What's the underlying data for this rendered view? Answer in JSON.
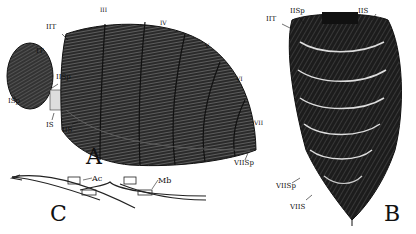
{
  "figure": {
    "panels": [
      {
        "id": "A",
        "label": "A",
        "description": "lateral view of abdomen"
      },
      {
        "id": "B",
        "label": "B",
        "description": "ventral view of abdomen"
      },
      {
        "id": "C",
        "label": "C",
        "description": "section of segments"
      }
    ],
    "panel_A_labels": {
      "IT": "IT",
      "IIT": "IIT",
      "III": "III",
      "IV": "IV",
      "V": "V",
      "VI": "VI",
      "VII": "VII",
      "ISp": "ISp",
      "IISp": "IISp",
      "IS": "IS",
      "IIS": "IIS",
      "VIISp": "VIISp"
    },
    "panel_B_labels": {
      "IIT": "IIT",
      "IISp": "IISp",
      "IIS": "IIS",
      "VIISp": "VIISp",
      "VIIS": "VIIS"
    },
    "panel_C_labels": {
      "Ac": "Ac",
      "Mb": "Mb"
    },
    "colors": {
      "ink": "#111111",
      "paper": "#ffffff",
      "mid": "#555555"
    }
  }
}
